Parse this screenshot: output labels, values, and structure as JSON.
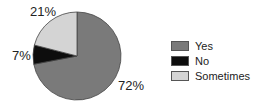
{
  "chart_data": {
    "type": "pie",
    "title": "",
    "categories": [
      "Yes",
      "No",
      "Sometimes"
    ],
    "values": [
      72,
      7,
      21
    ],
    "labels": [
      "72%",
      "7%",
      "21%"
    ],
    "colors": [
      "#7a7a7a",
      "#0d0d0d",
      "#d4d4d4"
    ],
    "legend_position": "right",
    "start_angle": "12 o'clock",
    "direction": "clockwise"
  },
  "legend": {
    "items": [
      {
        "label": "Yes",
        "color": "#7a7a7a"
      },
      {
        "label": "No",
        "color": "#0d0d0d"
      },
      {
        "label": "Sometimes",
        "color": "#d4d4d4"
      }
    ]
  },
  "slice_labels": {
    "yes": "72%",
    "no": "7%",
    "sometimes": "21%"
  }
}
